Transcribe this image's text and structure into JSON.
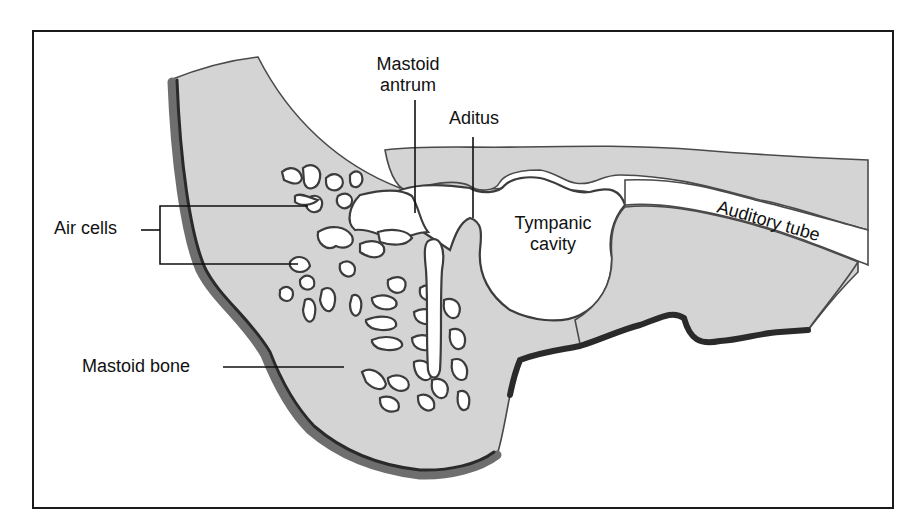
{
  "figure": {
    "frame": {
      "x": 33,
      "y": 31,
      "width": 860,
      "height": 477
    }
  },
  "labels": {
    "mastoid_antrum_line1": "Mastoid",
    "mastoid_antrum_line2": "antrum",
    "aditus": "Aditus",
    "air_cells": "Air cells",
    "tympanic_cavity_line1": "Tympanic",
    "tympanic_cavity_line2": "cavity",
    "auditory_tube": "Auditory tube",
    "mastoid_bone": "Mastoid bone"
  },
  "colors": {
    "bone_fill": "#d4d4d4",
    "bone_outline": "#4a4a4a",
    "cortex_dark": "#2a2a2a",
    "cortex_mid": "#6e6e6e",
    "speckle": "#9c9c9c",
    "air_space": "#ffffff",
    "text": "#111111"
  }
}
